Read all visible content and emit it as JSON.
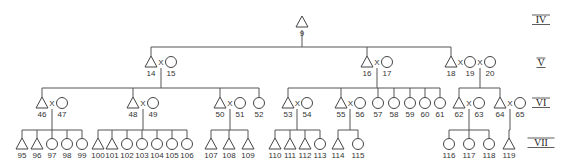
{
  "diagram": {
    "type": "pedigree",
    "generations": [
      {
        "label": "IV",
        "y": 23
      },
      {
        "label": "V",
        "y": 66
      },
      {
        "label": "VI",
        "y": 106
      },
      {
        "label": "VII",
        "y": 146
      }
    ],
    "individuals": [
      {
        "id": "9",
        "sex": "male",
        "x": 302,
        "y": 22
      },
      {
        "id": "14",
        "sex": "male",
        "x": 151,
        "y": 62
      },
      {
        "id": "15",
        "sex": "female",
        "x": 171,
        "y": 62
      },
      {
        "id": "16",
        "sex": "male",
        "x": 367,
        "y": 62
      },
      {
        "id": "17",
        "sex": "female",
        "x": 387,
        "y": 62
      },
      {
        "id": "18",
        "sex": "male",
        "x": 451,
        "y": 62
      },
      {
        "id": "19",
        "sex": "female",
        "x": 470,
        "y": 62
      },
      {
        "id": "20",
        "sex": "female",
        "x": 490,
        "y": 62
      },
      {
        "id": "46",
        "sex": "male",
        "x": 42,
        "y": 103
      },
      {
        "id": "47",
        "sex": "female",
        "x": 62,
        "y": 103
      },
      {
        "id": "48",
        "sex": "male",
        "x": 133,
        "y": 103
      },
      {
        "id": "49",
        "sex": "female",
        "x": 153,
        "y": 103
      },
      {
        "id": "50",
        "sex": "male",
        "x": 220,
        "y": 103
      },
      {
        "id": "51",
        "sex": "female",
        "x": 240,
        "y": 103
      },
      {
        "id": "52",
        "sex": "female",
        "x": 259,
        "y": 103
      },
      {
        "id": "53",
        "sex": "male",
        "x": 288,
        "y": 103
      },
      {
        "id": "54",
        "sex": "female",
        "x": 307,
        "y": 103
      },
      {
        "id": "55",
        "sex": "male",
        "x": 341,
        "y": 103
      },
      {
        "id": "56",
        "sex": "female",
        "x": 360,
        "y": 103
      },
      {
        "id": "57",
        "sex": "female",
        "x": 378,
        "y": 103
      },
      {
        "id": "58",
        "sex": "female",
        "x": 394,
        "y": 103
      },
      {
        "id": "59",
        "sex": "female",
        "x": 410,
        "y": 103
      },
      {
        "id": "60",
        "sex": "female",
        "x": 425,
        "y": 103
      },
      {
        "id": "61",
        "sex": "female",
        "x": 440,
        "y": 103
      },
      {
        "id": "62",
        "sex": "male",
        "x": 459,
        "y": 103
      },
      {
        "id": "63",
        "sex": "female",
        "x": 479,
        "y": 103
      },
      {
        "id": "64",
        "sex": "male",
        "x": 500,
        "y": 103
      },
      {
        "id": "65",
        "sex": "female",
        "x": 520,
        "y": 103
      },
      {
        "id": "95",
        "sex": "male",
        "x": 22,
        "y": 144
      },
      {
        "id": "96",
        "sex": "male",
        "x": 37,
        "y": 144
      },
      {
        "id": "97",
        "sex": "female",
        "x": 52,
        "y": 144
      },
      {
        "id": "98",
        "sex": "female",
        "x": 67,
        "y": 144
      },
      {
        "id": "99",
        "sex": "female",
        "x": 82,
        "y": 144
      },
      {
        "id": "100",
        "sex": "male",
        "x": 98,
        "y": 144
      },
      {
        "id": "101",
        "sex": "male",
        "x": 112,
        "y": 144
      },
      {
        "id": "102",
        "sex": "female",
        "x": 127,
        "y": 144
      },
      {
        "id": "103",
        "sex": "female",
        "x": 142,
        "y": 144
      },
      {
        "id": "104",
        "sex": "female",
        "x": 157,
        "y": 144
      },
      {
        "id": "105",
        "sex": "female",
        "x": 172,
        "y": 144
      },
      {
        "id": "106",
        "sex": "female",
        "x": 187,
        "y": 144
      },
      {
        "id": "107",
        "sex": "male",
        "x": 211,
        "y": 144
      },
      {
        "id": "108",
        "sex": "male",
        "x": 229,
        "y": 144
      },
      {
        "id": "109",
        "sex": "male",
        "x": 248,
        "y": 144
      },
      {
        "id": "110",
        "sex": "male",
        "x": 275,
        "y": 144
      },
      {
        "id": "111",
        "sex": "male",
        "x": 290,
        "y": 144
      },
      {
        "id": "112",
        "sex": "male",
        "x": 305,
        "y": 144
      },
      {
        "id": "113",
        "sex": "female",
        "x": 320,
        "y": 144
      },
      {
        "id": "114",
        "sex": "male",
        "x": 338,
        "y": 144
      },
      {
        "id": "115",
        "sex": "female",
        "x": 358,
        "y": 144
      },
      {
        "id": "116",
        "sex": "female",
        "x": 449,
        "y": 144
      },
      {
        "id": "117",
        "sex": "female",
        "x": 469,
        "y": 144
      },
      {
        "id": "118",
        "sex": "female",
        "x": 489,
        "y": 144
      },
      {
        "id": "119",
        "sex": "male",
        "x": 509,
        "y": 144
      }
    ],
    "unions": [
      {
        "partners": [
          "14",
          "15"
        ],
        "symbol": "X"
      },
      {
        "partners": [
          "16",
          "17"
        ],
        "symbol": "X"
      },
      {
        "partners": [
          "18",
          "19"
        ],
        "symbol": "X"
      },
      {
        "partners": [
          "19",
          "20"
        ],
        "symbol": "X"
      },
      {
        "partners": [
          "46",
          "47"
        ],
        "symbol": "X"
      },
      {
        "partners": [
          "48",
          "49"
        ],
        "symbol": "X"
      },
      {
        "partners": [
          "50",
          "51"
        ],
        "symbol": "X"
      },
      {
        "partners": [
          "53",
          "54"
        ],
        "symbol": "X"
      },
      {
        "partners": [
          "55",
          "56"
        ],
        "symbol": "X"
      },
      {
        "partners": [
          "62",
          "63"
        ],
        "symbol": "X"
      },
      {
        "partners": [
          "64",
          "65"
        ],
        "symbol": "X"
      }
    ],
    "sibships": [
      {
        "parent_line_x": 302,
        "parent_y": 30,
        "bar_y": 47,
        "children": [
          "14",
          "16",
          "18"
        ]
      },
      {
        "parent_line_x": 161,
        "parent_y": 68,
        "bar_y": 88,
        "children": [
          "46",
          "48",
          "50",
          "52"
        ]
      },
      {
        "parent_line_x": 377,
        "parent_y": 68,
        "bar_y": 88,
        "children": [
          "53",
          "55",
          "57",
          "58",
          "59",
          "60",
          "61"
        ]
      },
      {
        "parent_line_x": 480,
        "parent_y": 68,
        "bar_y": 88,
        "children": [
          "62",
          "64"
        ]
      },
      {
        "parent_line_x": 52,
        "parent_y": 109,
        "bar_y": 130,
        "children": [
          "95",
          "96",
          "97",
          "98",
          "99"
        ]
      },
      {
        "parent_line_x": 143,
        "parent_y": 109,
        "bar_y": 130,
        "children": [
          "100",
          "101",
          "102",
          "103",
          "104",
          "105",
          "106"
        ]
      },
      {
        "parent_line_x": 230,
        "parent_y": 109,
        "bar_y": 130,
        "children": [
          "107",
          "108",
          "109"
        ]
      },
      {
        "parent_line_x": 297,
        "parent_y": 109,
        "bar_y": 130,
        "children": [
          "110",
          "111",
          "112",
          "113"
        ]
      },
      {
        "parent_line_x": 350,
        "parent_y": 109,
        "bar_y": 130,
        "children": [
          "114",
          "115"
        ]
      },
      {
        "parent_line_x": 469,
        "parent_y": 109,
        "bar_y": 130,
        "children": [
          "116",
          "117",
          "118"
        ]
      },
      {
        "parent_line_x": 510,
        "parent_y": 109,
        "bar_y": 130,
        "children": [
          "119"
        ]
      }
    ],
    "colors": {
      "line": "#555555",
      "symbol": "#444444",
      "text": "#333333",
      "background": "#ffffff"
    }
  }
}
